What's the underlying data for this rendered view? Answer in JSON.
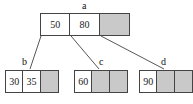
{
  "diagram": {
    "colors": {
      "empty_cell_fill": "#c9c9c9",
      "border": "#444444",
      "background": "#ffffff",
      "text": "#1a1a1a"
    },
    "nodes": [
      {
        "id": "root",
        "label": "a",
        "cells": [
          {
            "value": "50",
            "empty": false
          },
          {
            "value": "80",
            "empty": false
          },
          {
            "value": "",
            "empty": true
          }
        ]
      },
      {
        "id": "child-b",
        "label": "b",
        "cells": [
          {
            "value": "30",
            "empty": false
          },
          {
            "value": "35",
            "empty": false
          },
          {
            "value": "",
            "empty": true
          }
        ]
      },
      {
        "id": "child-c",
        "label": "c",
        "cells": [
          {
            "value": "60",
            "empty": false
          },
          {
            "value": "",
            "empty": true
          },
          {
            "value": "",
            "empty": true
          }
        ]
      },
      {
        "id": "child-d",
        "label": "d",
        "cells": [
          {
            "value": "90",
            "empty": false
          },
          {
            "value": "",
            "empty": true
          },
          {
            "value": "",
            "empty": true
          }
        ]
      }
    ],
    "edges": [
      {
        "from": "root-cell-0",
        "to": "child-b"
      },
      {
        "from": "root-cell-1",
        "to": "child-c"
      },
      {
        "from": "root-cell-2",
        "to": "child-d"
      }
    ]
  }
}
